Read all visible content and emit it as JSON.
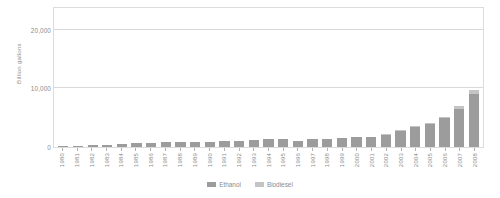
{
  "chart_data": {
    "type": "bar",
    "stacked": true,
    "title": "",
    "subtitle": "",
    "xlabel": "",
    "ylabel": "Billion gallons",
    "ylim": [
      0,
      24000
    ],
    "yticks": [
      0,
      10000,
      20000
    ],
    "ytick_labels": [
      "0",
      "10,000",
      "20,000"
    ],
    "grid": true,
    "legend_position": "bottom-center",
    "categories": [
      "1980",
      "1981",
      "1982",
      "1983",
      "1984",
      "1985",
      "1986",
      "1987",
      "1988",
      "1989",
      "1990",
      "1991",
      "1992",
      "1993",
      "1994",
      "1995",
      "1996",
      "1997",
      "1998",
      "1999",
      "2000",
      "2001",
      "2002",
      "2003",
      "2004",
      "2005",
      "2006",
      "2007",
      "2008"
    ],
    "series": [
      {
        "name": "Ethanol",
        "color": "#9c9c9c",
        "values": [
          175,
          215,
          350,
          375,
          430,
          610,
          710,
          830,
          845,
          870,
          900,
          950,
          1100,
          1150,
          1350,
          1400,
          1100,
          1300,
          1400,
          1470,
          1630,
          1770,
          2130,
          2800,
          3400,
          3904,
          4884,
          6500,
          9000
        ]
      },
      {
        "name": "Biodiesel",
        "color": "#c4c4c4",
        "values": [
          0,
          0,
          0,
          0,
          0,
          0,
          0,
          0,
          0,
          0,
          0,
          0,
          0,
          0,
          0,
          0,
          0,
          0,
          0,
          0,
          0,
          0,
          15,
          20,
          28,
          91,
          250,
          490,
          690
        ]
      }
    ]
  },
  "axis": {
    "ylabel": "Billion gallons",
    "ytick_top": "20,000",
    "ytick_mid": "10,000",
    "ytick_zero": "0"
  },
  "legend": {
    "items": [
      {
        "label": "Ethanol",
        "color": "#9c9c9c"
      },
      {
        "label": "Biodiesel",
        "color": "#c4c4c4"
      }
    ]
  }
}
